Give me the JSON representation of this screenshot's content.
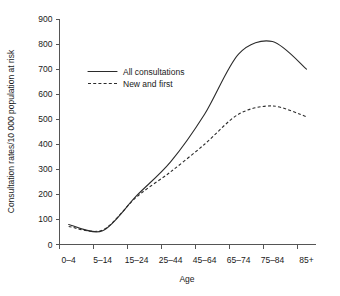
{
  "chart_data": {
    "type": "line",
    "title": "",
    "xlabel": "Age",
    "ylabel": "Consultation rates/10 000 population at risk",
    "categories": [
      "0–4",
      "5–14",
      "15–24",
      "25–44",
      "45–64",
      "65–74",
      "75–84",
      "85+"
    ],
    "ylim": [
      0,
      900
    ],
    "yticks": [
      0,
      100,
      200,
      300,
      400,
      500,
      600,
      700,
      800,
      900
    ],
    "ytick_labels": [
      "0",
      "100",
      "200",
      "300",
      "400",
      "500",
      "600",
      "700",
      "800",
      "900"
    ],
    "grid": false,
    "legend_position": "upper-left-inside",
    "series": [
      {
        "name": "All consultations",
        "style": "solid",
        "color": "#2b2b2b",
        "values": [
          80,
          55,
          195,
          330,
          520,
          760,
          810,
          700
        ]
      },
      {
        "name": "New and first",
        "style": "dashed",
        "color": "#2b2b2b",
        "values": [
          72,
          58,
          190,
          290,
          400,
          520,
          553,
          510
        ]
      }
    ]
  },
  "axes": {
    "y_title": "Consultation rates/10 000 population at risk",
    "x_title": "Age"
  },
  "legend": {
    "items": [
      {
        "label": "All consultations",
        "style": "solid"
      },
      {
        "label": "New and first",
        "style": "dashed"
      }
    ]
  }
}
